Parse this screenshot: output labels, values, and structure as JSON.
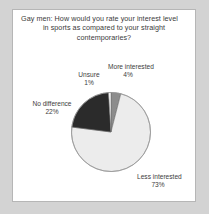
{
  "chart_data": {
    "type": "pie",
    "title": "Gay men: How would you rate your interest level in sports as compared to your straight contemporaries?",
    "title_lines": [
      "Gay men: How would you rate your interest level",
      "in sports as compared to your straight",
      "contemporaries?"
    ],
    "categories": [
      "More interested",
      "Less interested",
      "No difference",
      "Unsure"
    ],
    "values": [
      4,
      73,
      22,
      1
    ],
    "value_labels": [
      "4%",
      "73%",
      "22%",
      "1%"
    ],
    "colors": [
      "#8c8c8c",
      "#ececec",
      "#2b2b2b",
      "#fdfdfd"
    ],
    "units": "percent",
    "legend": "none",
    "labels_position": "outside",
    "start_angle_deg": 0,
    "direction": "clockwise",
    "slices": [
      {
        "name": "More interested",
        "value": 4,
        "label": "4%",
        "color": "#8c8c8c"
      },
      {
        "name": "Less interested",
        "value": 73,
        "label": "73%",
        "color": "#ececec"
      },
      {
        "name": "No difference",
        "value": 22,
        "label": "22%",
        "color": "#2b2b2b"
      },
      {
        "name": "Unsure",
        "value": 1,
        "label": "1%",
        "color": "#fdfdfd"
      }
    ]
  },
  "figure": {
    "background": "#d3d3d3",
    "panel_background": "#ffffff",
    "border_color": "#b6b6b6",
    "text_color": "#3d3d3d"
  }
}
